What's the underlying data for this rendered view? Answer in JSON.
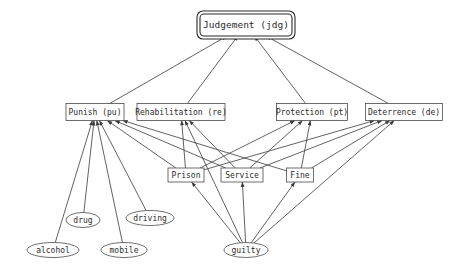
{
  "diagram": {
    "background_color": "#ffffff",
    "edge_color": "#3a3a3a",
    "node_stroke_color": "#4a4a4a",
    "root_stroke_color": "#2a2a2a",
    "label_color": "#2b2b2b"
  },
  "nodes": {
    "judgement": {
      "label": "Judgement (jdg)",
      "shape": "double-rounded-rect",
      "x": 246,
      "y": 25,
      "w": 92,
      "h": 22
    },
    "punish": {
      "label": "Punish (pu)",
      "shape": "rect",
      "x": 95,
      "y": 112,
      "w": 58,
      "h": 17
    },
    "rehabilitation": {
      "label": "Rehabilitation (re)",
      "shape": "rect",
      "x": 181,
      "y": 112,
      "w": 88,
      "h": 17
    },
    "protection": {
      "label": "Protection (pt)",
      "shape": "rect",
      "x": 312,
      "y": 112,
      "w": 71,
      "h": 17
    },
    "deterrence": {
      "label": "Deterrence (de)",
      "shape": "rect",
      "x": 404,
      "y": 112,
      "w": 77,
      "h": 17
    },
    "prison": {
      "label": "Prison",
      "shape": "rect",
      "x": 186,
      "y": 175,
      "w": 36,
      "h": 14
    },
    "service": {
      "label": "Service",
      "shape": "rect",
      "x": 242,
      "y": 175,
      "w": 42,
      "h": 14
    },
    "fine": {
      "label": "Fine",
      "shape": "rect",
      "x": 300,
      "y": 175,
      "w": 27,
      "h": 14
    },
    "drug": {
      "label": "drug",
      "shape": "ellipse",
      "x": 83,
      "y": 220,
      "w": 34,
      "h": 15
    },
    "driving": {
      "label": "driving",
      "shape": "ellipse",
      "x": 150,
      "y": 218,
      "w": 48,
      "h": 15
    },
    "alcohol": {
      "label": "alcohol",
      "shape": "ellipse",
      "x": 53,
      "y": 250,
      "w": 52,
      "h": 15
    },
    "mobile": {
      "label": "mobile",
      "shape": "ellipse",
      "x": 124,
      "y": 250,
      "w": 46,
      "h": 15
    },
    "guilty": {
      "label": "guilty",
      "shape": "ellipse",
      "x": 246,
      "y": 250,
      "w": 44,
      "h": 15
    }
  },
  "edges": [
    {
      "from": "punish",
      "to": "judgement"
    },
    {
      "from": "rehabilitation",
      "to": "judgement"
    },
    {
      "from": "protection",
      "to": "judgement"
    },
    {
      "from": "deterrence",
      "to": "judgement"
    },
    {
      "from": "prison",
      "to": "punish"
    },
    {
      "from": "service",
      "to": "punish"
    },
    {
      "from": "fine",
      "to": "punish"
    },
    {
      "from": "prison",
      "to": "rehabilitation"
    },
    {
      "from": "service",
      "to": "rehabilitation"
    },
    {
      "from": "prison",
      "to": "protection"
    },
    {
      "from": "service",
      "to": "protection"
    },
    {
      "from": "fine",
      "to": "protection"
    },
    {
      "from": "prison",
      "to": "deterrence"
    },
    {
      "from": "service",
      "to": "deterrence"
    },
    {
      "from": "fine",
      "to": "deterrence"
    },
    {
      "from": "alcohol",
      "to": "punish"
    },
    {
      "from": "drug",
      "to": "punish"
    },
    {
      "from": "mobile",
      "to": "punish"
    },
    {
      "from": "driving",
      "to": "punish"
    },
    {
      "from": "guilty",
      "to": "prison"
    },
    {
      "from": "guilty",
      "to": "service"
    },
    {
      "from": "guilty",
      "to": "fine"
    },
    {
      "from": "guilty",
      "to": "rehabilitation"
    },
    {
      "from": "guilty",
      "to": "deterrence"
    }
  ]
}
